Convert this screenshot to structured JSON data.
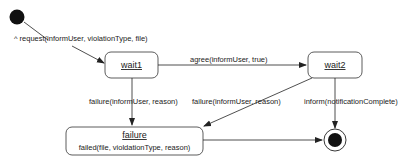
{
  "diagram": {
    "type": "state-machine",
    "states": [
      {
        "id": "initial",
        "kind": "initial"
      },
      {
        "id": "wait1",
        "name": "wait1"
      },
      {
        "id": "wait2",
        "name": "wait2"
      },
      {
        "id": "failure",
        "name": "failure",
        "action": "failed(file, violdationType, reason)"
      },
      {
        "id": "final",
        "kind": "final"
      }
    ],
    "transitions": [
      {
        "from": "initial",
        "to": "wait1",
        "label": "^ request(informUser, violationType, file)"
      },
      {
        "from": "wait1",
        "to": "wait2",
        "label": "agree(informUser, true)"
      },
      {
        "from": "wait1",
        "to": "failure",
        "label": "failure(informUser, reason)"
      },
      {
        "from": "wait2",
        "to": "failure",
        "label": "failure(informUser, reason)"
      },
      {
        "from": "wait2",
        "to": "final",
        "label": "inform(notificationComplete)"
      },
      {
        "from": "failure",
        "to": "final",
        "label": ""
      }
    ]
  }
}
